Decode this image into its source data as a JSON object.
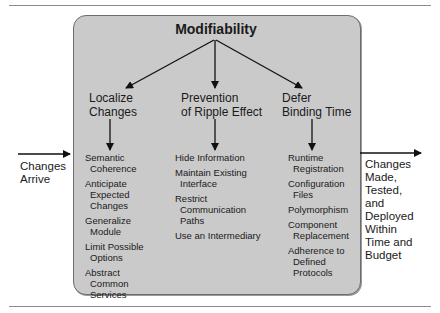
{
  "diagram": {
    "title": "Modifiability",
    "input_label": [
      "Changes",
      "Arrive"
    ],
    "output_label": [
      "Changes",
      "Made,",
      "Tested,",
      "and",
      "Deployed",
      "Within",
      "Time and",
      "Budget"
    ],
    "columns": [
      {
        "heading": [
          "Localize",
          "Changes"
        ],
        "tactics": [
          [
            "Semantic",
            "Coherence"
          ],
          [
            "Anticipate",
            "Expected",
            "Changes"
          ],
          [
            "Generalize",
            "Module"
          ],
          [
            "Limit Possible",
            "Options"
          ],
          [
            "Abstract",
            "Common",
            "Services"
          ]
        ]
      },
      {
        "heading": [
          "Prevention",
          "of Ripple Effect"
        ],
        "tactics": [
          [
            "Hide Information"
          ],
          [
            "Maintain Existing",
            "Interface"
          ],
          [
            "Restrict",
            "Communication",
            "Paths"
          ],
          [
            "Use an Intermediary"
          ]
        ]
      },
      {
        "heading": [
          "Defer",
          "Binding Time"
        ],
        "tactics": [
          [
            "Runtime",
            "Registration"
          ],
          [
            "Configuration",
            "Files"
          ],
          [
            "Polymorphism"
          ],
          [
            "Component",
            "Replacement"
          ],
          [
            "Adherence to",
            "Defined",
            "Protocols"
          ]
        ]
      }
    ],
    "colors": {
      "box_fill": "#cacaca",
      "box_border": "#6d6d6d",
      "arrow": "#111111",
      "rule": "#8a8a8a"
    }
  }
}
